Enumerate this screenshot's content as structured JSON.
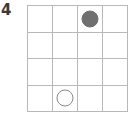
{
  "item": {
    "number_label": "4"
  },
  "grid": {
    "rows": 4,
    "columns": 4,
    "line_color": "#b8b8b8",
    "background_color": "#ffffff"
  },
  "tokens": [
    {
      "name": "filled-circle",
      "style": "filled",
      "row": 1,
      "column": 3,
      "color": "#6f6f6f"
    },
    {
      "name": "open-circle",
      "style": "open",
      "row": 4,
      "column": 2,
      "color": "#8a8a8a"
    }
  ],
  "cells": [
    {
      "row": 1,
      "column": 1,
      "token": null
    },
    {
      "row": 1,
      "column": 2,
      "token": null
    },
    {
      "row": 1,
      "column": 3,
      "token": "filled"
    },
    {
      "row": 1,
      "column": 4,
      "token": null
    },
    {
      "row": 2,
      "column": 1,
      "token": null
    },
    {
      "row": 2,
      "column": 2,
      "token": null
    },
    {
      "row": 2,
      "column": 3,
      "token": null
    },
    {
      "row": 2,
      "column": 4,
      "token": null
    },
    {
      "row": 3,
      "column": 1,
      "token": null
    },
    {
      "row": 3,
      "column": 2,
      "token": null
    },
    {
      "row": 3,
      "column": 3,
      "token": null
    },
    {
      "row": 3,
      "column": 4,
      "token": null
    },
    {
      "row": 4,
      "column": 1,
      "token": null
    },
    {
      "row": 4,
      "column": 2,
      "token": "open"
    },
    {
      "row": 4,
      "column": 3,
      "token": null
    },
    {
      "row": 4,
      "column": 4,
      "token": null
    }
  ]
}
